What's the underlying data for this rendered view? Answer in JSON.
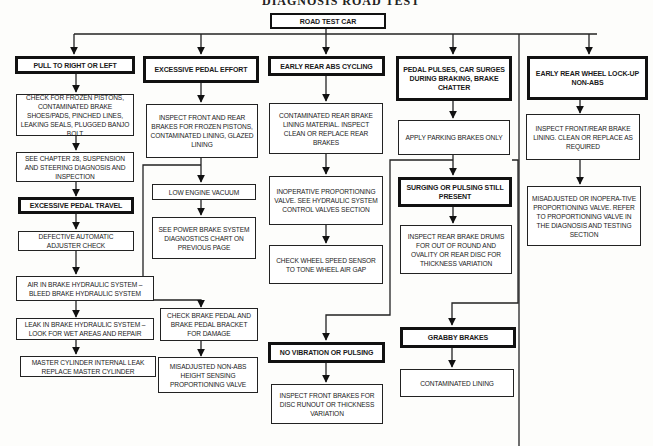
{
  "diagram": {
    "title_partial": "DIAGNOSIS ROAD TEST",
    "root": "ROAD TEST CAR",
    "columns": [
      {
        "header": "PULL TO RIGHT OR LEFT",
        "steps": [
          "CHECK FOR FROZEN PISTONS, CONTAMINATED BRAKE SHOES/PADS, PINCHED LINES, LEAKING SEALS, PLUGGED BANJO BOLT",
          "SEE CHAPTER 28, SUSPENSION AND STEERING DIAGNOSIS AND INSPECTION"
        ],
        "sub_header": "EXCESSIVE PEDAL TRAVEL",
        "sub_steps": [
          "DEFECTIVE AUTOMATIC ADJUSTER CHECK",
          "AIR IN BRAKE HYDRAULIC SYSTEM – BLEED BRAKE HYDRAULIC SYSTEM",
          "LEAK IN BRAKE HYDRAULIC SYSTEM – LOOK FOR WET AREAS AND REPAIR",
          "MASTER CYLINDER INTERNAL LEAK REPLACE MASTER CYLINDER"
        ]
      },
      {
        "header": "EXCESSIVE PEDAL EFFORT",
        "steps": [
          "INSPECT FRONT AND REAR BRAKES FOR FROZEN PISTONS, CONTAMINATED LINING, GLAZED LINING",
          "LOW ENGINE VACUUM",
          "SEE POWER BRAKE SYSTEM DIAGNOSTICS CHART ON PREVIOUS PAGE",
          "CHECK BRAKE PEDAL AND BRAKE PEDAL BRACKET FOR DAMAGE",
          "MISADJUSTED NON-ABS HEIGHT SENSING PROPORTIONING VALVE"
        ]
      },
      {
        "header": "EARLY REAR ABS CYCLING",
        "steps": [
          "CONTAMINATED REAR BRAKE LINING MATERIAL. INSPECT CLEAN OR REPLACE REAR BRAKES",
          "INOPERATIVE PROPORTIONING VALVE. SEE HYDRAULIC SYSTEM CONTROL VALVES SECTION",
          "CHECK WHEEL SPEED SENSOR TO TONE WHEEL AIR GAP"
        ]
      },
      {
        "header": "PEDAL PULSES, CAR SURGES DURING BRAKING, BRAKE CHATTER",
        "steps": [
          "APPLY PARKING BRAKES ONLY"
        ],
        "sub_header": "SURGING OR PULSING STILL PRESENT",
        "sub_steps": [
          "INSPECT REAR BRAKE DRUMS FOR OUT OF ROUND AND OVALITY OR REAR DISC FOR THICKNESS VARIATION"
        ],
        "branch_no_vibration": "NO VIBRATION OR PULSING",
        "branch_no_vibration_step": "INSPECT FRONT BRAKES FOR DISC RUNOUT OR THICKNESS VARIATION",
        "branch_grabby": "GRABBY BRAKES",
        "branch_grabby_step": "CONTAMINATED LINING"
      },
      {
        "header": "EARLY REAR WHEEL LOCK-UP NON-ABS",
        "steps": [
          "INSPECT FRONT/REAR BRAKE LINING. CLEAN OR REPLACE AS REQUIRED",
          "MISADJUSTED OR INOPERA-TIVE PROPORTIONING VALVE. REFER TO PROPORTIONING VALVE IN THE DIAGNOSIS AND TESTING SECTION"
        ]
      }
    ]
  }
}
